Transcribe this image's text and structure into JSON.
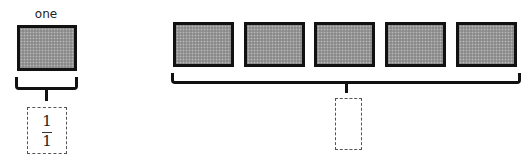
{
  "left_model": {
    "label": "one",
    "box_count": 1,
    "answer": {
      "numerator": "1",
      "denominator": "1"
    }
  },
  "right_model": {
    "box_count": 5,
    "answer": {
      "numerator": "",
      "denominator": ""
    }
  },
  "colors": {
    "box_fill": "#8a8a8a",
    "box_border": "#111111",
    "dashed_border": "#555555"
  }
}
